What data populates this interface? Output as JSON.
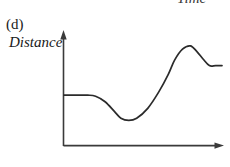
{
  "figure": {
    "panel_label": "(d)",
    "y_axis_label": "Distance",
    "x_axis_label": "Time",
    "x_axis_label_above": "Time",
    "line_color": "#2b2b2b",
    "axis_color": "#3a3a3a",
    "background_color": "#ffffff"
  },
  "chart_data": {
    "type": "line",
    "title": "(d)",
    "xlabel": "Time",
    "ylabel": "Distance",
    "grid": false,
    "legend": null,
    "axis_ticks": {
      "x": [],
      "y": []
    },
    "xlim": [
      0,
      100
    ],
    "ylim": [
      0,
      100
    ],
    "series": [
      {
        "name": "Distance",
        "x": [
          0,
          15,
          20,
          26,
          32,
          36,
          41,
          46,
          53,
          60,
          66,
          70,
          75,
          80,
          84,
          88,
          92,
          96,
          100
        ],
        "y": [
          46,
          46,
          45,
          40,
          31,
          25,
          23,
          25,
          34,
          49,
          65,
          78,
          88,
          91,
          86,
          79,
          73,
          73,
          73
        ]
      }
    ],
    "key_points": [
      {
        "label": "initial-plateau",
        "x": 0,
        "y": 46
      },
      {
        "label": "start-of-decline",
        "x": 15,
        "y": 46
      },
      {
        "label": "minimum",
        "x": 41,
        "y": 23
      },
      {
        "label": "inflection-rise",
        "x": 56,
        "y": 40
      },
      {
        "label": "maximum-overshoot",
        "x": 80,
        "y": 91
      },
      {
        "label": "final-plateau",
        "x": 100,
        "y": 73
      }
    ]
  }
}
